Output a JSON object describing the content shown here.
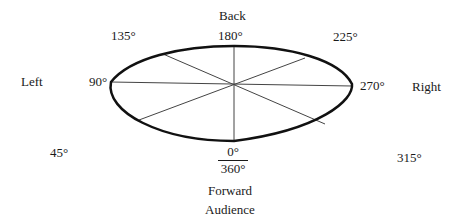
{
  "diagram": {
    "directions": {
      "back": "Back",
      "left": "Left",
      "right": "Right",
      "forward": "Forward",
      "audience": "Audience"
    },
    "angles": {
      "a0": "0°",
      "a360": "360°",
      "a45": "45°",
      "a90": "90°",
      "a135": "135°",
      "a180": "180°",
      "a225": "225°",
      "a270": "270°",
      "a315": "315°"
    },
    "colors": {
      "stroke": "#111111",
      "spoke": "#444444",
      "background": "#ffffff"
    }
  }
}
